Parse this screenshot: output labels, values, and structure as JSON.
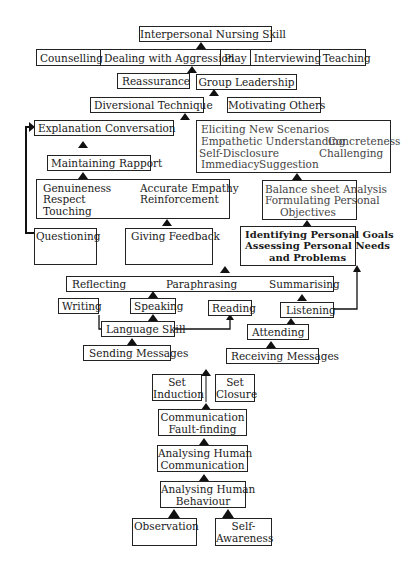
{
  "diagram": {
    "title": "Interpersonal Nursing Skill",
    "applications": [
      "Counselling",
      "Dealing with Aggression",
      "Play",
      "Interviewing",
      "Teaching"
    ],
    "reassurance": "Reassurance",
    "group_leadership": "Group Leadership",
    "diversional_technique": "Diversional Technique",
    "motivating_others": "Motivating Others",
    "explanation_row": {
      "left": "Explanation",
      "right": "Conversation"
    },
    "maintaining_rapport": "Maintaining Rapport",
    "rapport_skills": {
      "left": [
        "Genuineness",
        "Respect",
        "Touching"
      ],
      "right": [
        "Accurate Empathy",
        "Reinforcement"
      ]
    },
    "counselling_skills": {
      "line1": "Eliciting New Scenarios",
      "line2a": "Empathetic Understanding",
      "line2b": "Concreteness",
      "line3a": "Self-Disclosure",
      "line3b": "Challenging",
      "line4a": "Immediacy",
      "line4b": "Suggestion"
    },
    "balance_sheet": [
      "Balance sheet Analysis",
      "Formulating Personal",
      "Objectives"
    ],
    "identifying_goals": [
      "Identifying Personal Goals",
      "Assessing Personal Needs",
      "and Problems"
    ],
    "questioning": "Questioning",
    "giving_feedback": "Giving Feedback",
    "reflecting_row": {
      "a": "Reflecting",
      "b": "Paraphrasing",
      "c": "Summarising"
    },
    "writing": "Writing",
    "speaking": "Speaking",
    "reading": "Reading",
    "listening": "Listening",
    "language_skill": "Language Skill",
    "attending": "Attending",
    "sending_messages": "Sending Messages",
    "receiving_messages": "Receiving Messages",
    "set_induction": [
      "Set",
      "Induction"
    ],
    "set_closure": [
      "Set",
      "Closure"
    ],
    "communication_fault_finding": [
      "Communication",
      "Fault-finding"
    ],
    "analysing_communication": [
      "Analysing Human",
      "Communication"
    ],
    "analysing_behaviour": [
      "Analysing Human",
      "Behaviour"
    ],
    "observation": "Observation",
    "self_awareness": [
      "Self-",
      "Awareness"
    ]
  }
}
